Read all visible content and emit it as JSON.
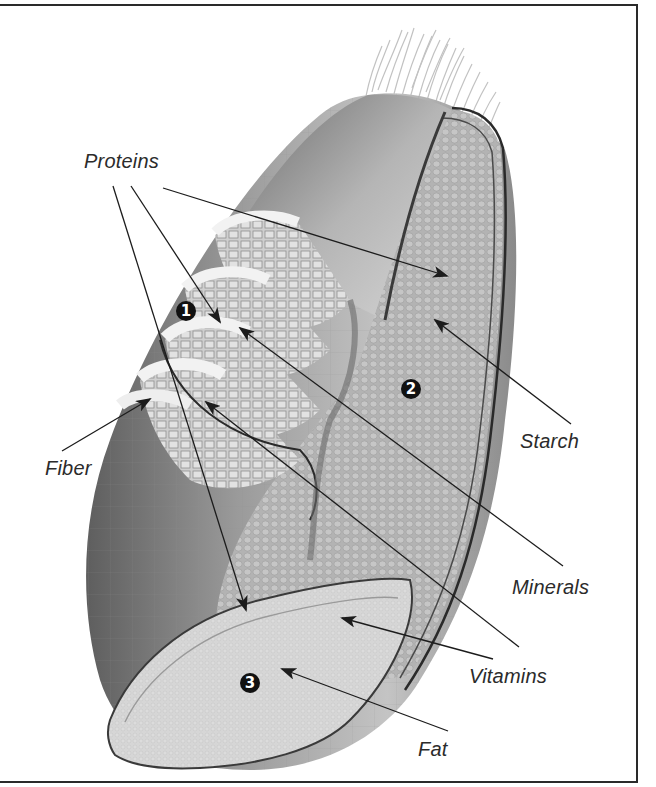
{
  "figure": {
    "labels": {
      "proteins": "Proteins",
      "fiber": "Fiber",
      "starch": "Starch",
      "minerals": "Minerals",
      "vitamins": "Vitamins",
      "fat": "Fat"
    },
    "markers": {
      "bran": "1",
      "endosperm": "2",
      "germ": "3"
    },
    "colors": {
      "frame": "#2a2a2a",
      "text": "#2b2b2b",
      "marker_bg": "#111111",
      "kernel_dark": "#6e6e6e",
      "kernel_mid": "#a8a8a8",
      "endosperm": "#b9b9b9",
      "germ": "#d4d4d4",
      "hairs": "#bdbdbd"
    }
  }
}
